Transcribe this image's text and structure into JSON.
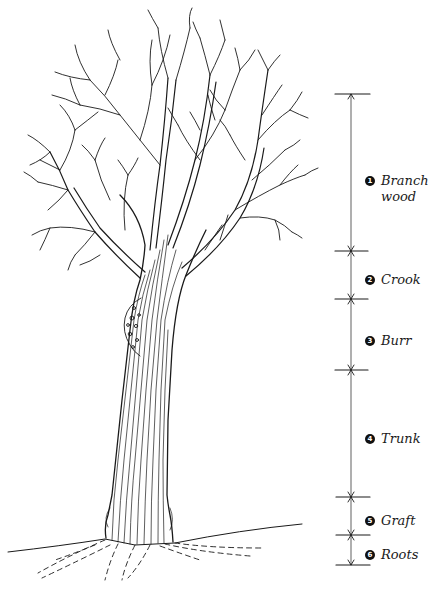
{
  "figure": {
    "ink_color": "#1a1a1a",
    "background": "#ffffff"
  },
  "measure_bar": {
    "x": 351,
    "ticks_y": [
      94,
      251,
      299,
      370,
      497,
      535,
      565
    ]
  },
  "parts": [
    {
      "number": "1",
      "label_line1": "Branch",
      "label_line2": "wood",
      "y": 176
    },
    {
      "number": "2",
      "label_line1": "Crook",
      "label_line2": "",
      "y": 275
    },
    {
      "number": "3",
      "label_line1": "Burr",
      "label_line2": "",
      "y": 336
    },
    {
      "number": "4",
      "label_line1": "Trunk",
      "label_line2": "",
      "y": 434
    },
    {
      "number": "5",
      "label_line1": "Graft",
      "label_line2": "",
      "y": 516
    },
    {
      "number": "6",
      "label_line1": "Roots",
      "label_line2": "",
      "y": 550
    }
  ]
}
